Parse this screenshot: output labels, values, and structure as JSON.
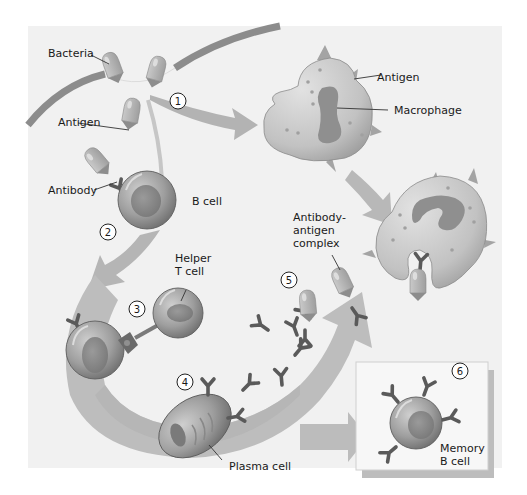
{
  "diagram": {
    "labels": {
      "bacteria": "Bacteria",
      "antigen_top": "Antigen",
      "antigen_macrophage": "Antigen",
      "macrophage": "Macrophage",
      "antibody": "Antibody",
      "b_cell": "B cell",
      "helper_t_cell_line1": "Helper",
      "helper_t_cell_line2": "T cell",
      "complex_line1": "Antibody-",
      "complex_line2": "antigen",
      "complex_line3": "complex",
      "plasma_cell": "Plasma cell",
      "memory_b_cell_line1": "Memory",
      "memory_b_cell_line2": "B cell"
    },
    "steps": [
      "1",
      "2",
      "3",
      "4",
      "5",
      "6"
    ],
    "colors": {
      "panel_bg": "#f1f1f1",
      "arrow": "#b9b9b9",
      "arrow_dark": "#a6a6a6",
      "skin": "#8a8a8a",
      "cell_body": "#9c9c9c",
      "cell_nucleus": "#7e7e7e",
      "macrophage_body": "#c4c4c4",
      "macrophage_nucleus": "#8f8f8f",
      "antibody": "#5f5f5f",
      "bacteria": "#b2b2b2"
    }
  }
}
